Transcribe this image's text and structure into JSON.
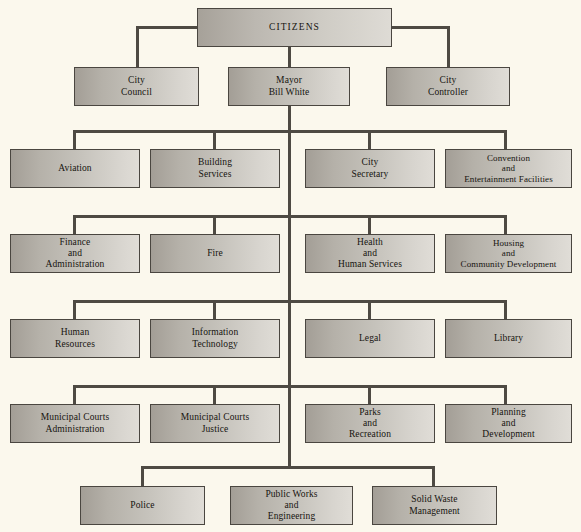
{
  "diagram": {
    "background_color": "#fbf8ed",
    "box_border_color": "#4a4640",
    "connector_color": "#4e4a43",
    "box_fill_start": "#a39e96",
    "box_fill_end": "#e0ddd7"
  },
  "nodes": {
    "citizens": "CITIZENS",
    "city_council": "City\nCouncil",
    "mayor": "Mayor\nBill White",
    "city_controller": "City\nController",
    "aviation": "Aviation",
    "building_services": "Building\nServices",
    "city_secretary": "City\nSecretary",
    "convention": "Convention\nand\nEntertainment Facilities",
    "finance": "Finance\nand\nAdministration",
    "fire": "Fire",
    "health": "Health\nand\nHuman Services",
    "housing": "Housing\nand\nCommunity Development",
    "human_resources": "Human\nResources",
    "information_technology": "Information\nTechnology",
    "legal": "Legal",
    "library": "Library",
    "municipal_courts_admin": "Municipal Courts\nAdministration",
    "municipal_courts_justice": "Municipal Courts\nJustice",
    "parks": "Parks\nand\nRecreation",
    "planning": "Planning\nand\nDevelopment",
    "police": "Police",
    "public_works": "Public Works\nand\nEngineering",
    "solid_waste": "Solid Waste\nManagement"
  }
}
